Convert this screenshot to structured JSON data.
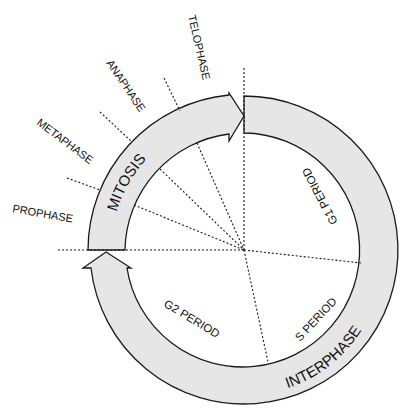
{
  "diagram": {
    "phases": {
      "mitosis": "MITOSIS",
      "interphase": "INTERPHASE"
    },
    "mitosis_stages": [
      "PROPHASE",
      "METAPHASE",
      "ANAPHASE",
      "TELOPHASE"
    ],
    "interphase_periods": [
      "G1 PERIOD",
      "S PERIOD",
      "G2 PERIOD"
    ],
    "labels": {
      "prophase": "PROPHASE",
      "metaphase": "METAPHASE",
      "anaphase": "ANAPHASE",
      "telophase": "TELOPHASE",
      "mitosis": "MITOSIS",
      "interphase": "INTERPHASE",
      "g1": "G1 PERIOD",
      "s": "S PERIOD",
      "g2": "G2 PERIOD"
    },
    "colors": {
      "ring_fill": "#e6e6e6",
      "stroke": "#1a1a1a",
      "background": "#ffffff"
    }
  }
}
